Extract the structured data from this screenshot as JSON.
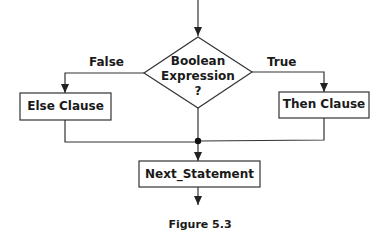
{
  "diagram": {
    "type": "flowchart",
    "decision": {
      "line1": "Boolean",
      "line2": "Expression",
      "line3": "?"
    },
    "branches": {
      "false_label": "False",
      "true_label": "True"
    },
    "boxes": {
      "else": "Else Clause",
      "then": "Then Clause",
      "next": "Next_Statement"
    },
    "caption": "Figure 5.3",
    "colors": {
      "stroke": "#333333",
      "text": "#1a1a1a",
      "background": "#ffffff"
    }
  }
}
